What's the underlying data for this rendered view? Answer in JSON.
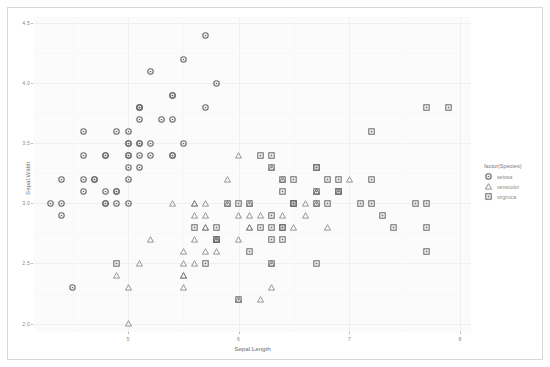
{
  "chart_data": {
    "type": "scatter",
    "title": "",
    "xlabel": "Sepal.Length",
    "ylabel": "Sepal.Width",
    "xlim": [
      4.15,
      8.1
    ],
    "ylim": [
      1.93,
      4.55
    ],
    "xticks": [
      5,
      6,
      7,
      8
    ],
    "xticklabels": [
      "5",
      "6",
      "7",
      "8"
    ],
    "yticks": [
      2.0,
      2.5,
      3.0,
      3.5,
      4.0,
      4.5
    ],
    "yticklabels": [
      "2.0",
      "2.5",
      "3.0",
      "3.5",
      "4.0",
      "4.5"
    ],
    "grid": true,
    "legend": {
      "title": "factor(Species)",
      "position": "right",
      "entries": [
        {
          "label": "setosa",
          "shape": "circle"
        },
        {
          "label": "versicolor",
          "shape": "triangle"
        },
        {
          "label": "virginica",
          "shape": "square"
        }
      ]
    },
    "marker_color": "#6b6b6b",
    "panel_color": "#fbfbfb",
    "gridline_color": "#f0f0f0",
    "series": [
      {
        "name": "setosa",
        "shape": "circle",
        "points": [
          [
            5.1,
            3.5
          ],
          [
            4.9,
            3.0
          ],
          [
            4.7,
            3.2
          ],
          [
            4.6,
            3.1
          ],
          [
            5.0,
            3.6
          ],
          [
            5.4,
            3.9
          ],
          [
            4.6,
            3.4
          ],
          [
            5.0,
            3.4
          ],
          [
            4.4,
            2.9
          ],
          [
            4.9,
            3.1
          ],
          [
            5.4,
            3.7
          ],
          [
            4.8,
            3.4
          ],
          [
            4.8,
            3.0
          ],
          [
            4.3,
            3.0
          ],
          [
            5.8,
            4.0
          ],
          [
            5.7,
            4.4
          ],
          [
            5.4,
            3.9
          ],
          [
            5.1,
            3.5
          ],
          [
            5.7,
            3.8
          ],
          [
            5.1,
            3.8
          ],
          [
            5.4,
            3.4
          ],
          [
            5.1,
            3.7
          ],
          [
            4.6,
            3.6
          ],
          [
            5.1,
            3.3
          ],
          [
            4.8,
            3.4
          ],
          [
            5.0,
            3.0
          ],
          [
            5.0,
            3.4
          ],
          [
            5.2,
            3.5
          ],
          [
            5.2,
            3.4
          ],
          [
            4.7,
            3.2
          ],
          [
            4.8,
            3.1
          ],
          [
            5.4,
            3.4
          ],
          [
            5.2,
            4.1
          ],
          [
            5.5,
            4.2
          ],
          [
            4.9,
            3.1
          ],
          [
            5.0,
            3.2
          ],
          [
            5.5,
            3.5
          ],
          [
            4.9,
            3.6
          ],
          [
            4.4,
            3.0
          ],
          [
            5.1,
            3.4
          ],
          [
            5.0,
            3.5
          ],
          [
            4.5,
            2.3
          ],
          [
            4.4,
            3.2
          ],
          [
            5.0,
            3.5
          ],
          [
            5.1,
            3.8
          ],
          [
            4.8,
            3.0
          ],
          [
            5.1,
            3.8
          ],
          [
            4.6,
            3.2
          ],
          [
            5.3,
            3.7
          ],
          [
            5.0,
            3.3
          ]
        ]
      },
      {
        "name": "versicolor",
        "shape": "triangle",
        "points": [
          [
            7.0,
            3.2
          ],
          [
            6.4,
            3.2
          ],
          [
            6.9,
            3.1
          ],
          [
            5.5,
            2.3
          ],
          [
            6.5,
            2.8
          ],
          [
            5.7,
            2.8
          ],
          [
            6.3,
            3.3
          ],
          [
            4.9,
            2.4
          ],
          [
            6.6,
            2.9
          ],
          [
            5.2,
            2.7
          ],
          [
            5.0,
            2.0
          ],
          [
            5.9,
            3.0
          ],
          [
            6.0,
            2.2
          ],
          [
            6.1,
            2.9
          ],
          [
            5.6,
            2.9
          ],
          [
            6.7,
            3.1
          ],
          [
            5.6,
            3.0
          ],
          [
            5.8,
            2.7
          ],
          [
            6.2,
            2.2
          ],
          [
            5.6,
            2.5
          ],
          [
            5.9,
            3.2
          ],
          [
            6.1,
            2.8
          ],
          [
            6.3,
            2.5
          ],
          [
            6.1,
            2.8
          ],
          [
            6.4,
            2.9
          ],
          [
            6.6,
            3.0
          ],
          [
            6.8,
            2.8
          ],
          [
            6.7,
            3.0
          ],
          [
            6.0,
            2.9
          ],
          [
            5.7,
            2.6
          ],
          [
            5.5,
            2.4
          ],
          [
            5.5,
            2.4
          ],
          [
            5.8,
            2.7
          ],
          [
            6.0,
            2.7
          ],
          [
            5.4,
            3.0
          ],
          [
            6.0,
            3.4
          ],
          [
            6.7,
            3.1
          ],
          [
            6.3,
            2.3
          ],
          [
            5.6,
            3.0
          ],
          [
            5.5,
            2.5
          ],
          [
            5.5,
            2.6
          ],
          [
            6.1,
            3.0
          ],
          [
            5.8,
            2.6
          ],
          [
            5.0,
            2.3
          ],
          [
            5.6,
            2.7
          ],
          [
            5.7,
            3.0
          ],
          [
            5.7,
            2.9
          ],
          [
            6.2,
            2.9
          ],
          [
            5.1,
            2.5
          ],
          [
            5.7,
            2.8
          ]
        ]
      },
      {
        "name": "virginica",
        "shape": "square",
        "points": [
          [
            6.3,
            3.3
          ],
          [
            5.8,
            2.7
          ],
          [
            7.1,
            3.0
          ],
          [
            6.3,
            2.9
          ],
          [
            6.5,
            3.0
          ],
          [
            7.6,
            3.0
          ],
          [
            4.9,
            2.5
          ],
          [
            7.3,
            2.9
          ],
          [
            6.7,
            2.5
          ],
          [
            7.2,
            3.6
          ],
          [
            6.5,
            3.2
          ],
          [
            6.4,
            2.7
          ],
          [
            6.8,
            3.0
          ],
          [
            5.7,
            2.5
          ],
          [
            5.8,
            2.8
          ],
          [
            6.4,
            3.2
          ],
          [
            6.5,
            3.0
          ],
          [
            7.7,
            3.8
          ],
          [
            7.7,
            2.6
          ],
          [
            6.0,
            2.2
          ],
          [
            6.9,
            3.2
          ],
          [
            5.6,
            2.8
          ],
          [
            7.7,
            2.8
          ],
          [
            6.3,
            2.7
          ],
          [
            6.7,
            3.3
          ],
          [
            7.2,
            3.2
          ],
          [
            6.2,
            2.8
          ],
          [
            6.1,
            3.0
          ],
          [
            6.4,
            2.8
          ],
          [
            7.2,
            3.0
          ],
          [
            7.4,
            2.8
          ],
          [
            7.9,
            3.8
          ],
          [
            6.4,
            2.8
          ],
          [
            6.3,
            2.8
          ],
          [
            6.1,
            2.6
          ],
          [
            7.7,
            3.0
          ],
          [
            6.3,
            3.4
          ],
          [
            6.4,
            3.1
          ],
          [
            6.0,
            3.0
          ],
          [
            6.9,
            3.1
          ],
          [
            6.7,
            3.1
          ],
          [
            6.9,
            3.1
          ],
          [
            5.8,
            2.7
          ],
          [
            6.8,
            3.2
          ],
          [
            6.7,
            3.3
          ],
          [
            6.7,
            3.0
          ],
          [
            6.3,
            2.5
          ],
          [
            6.5,
            3.0
          ],
          [
            6.2,
            3.4
          ],
          [
            5.9,
            3.0
          ]
        ]
      }
    ]
  }
}
